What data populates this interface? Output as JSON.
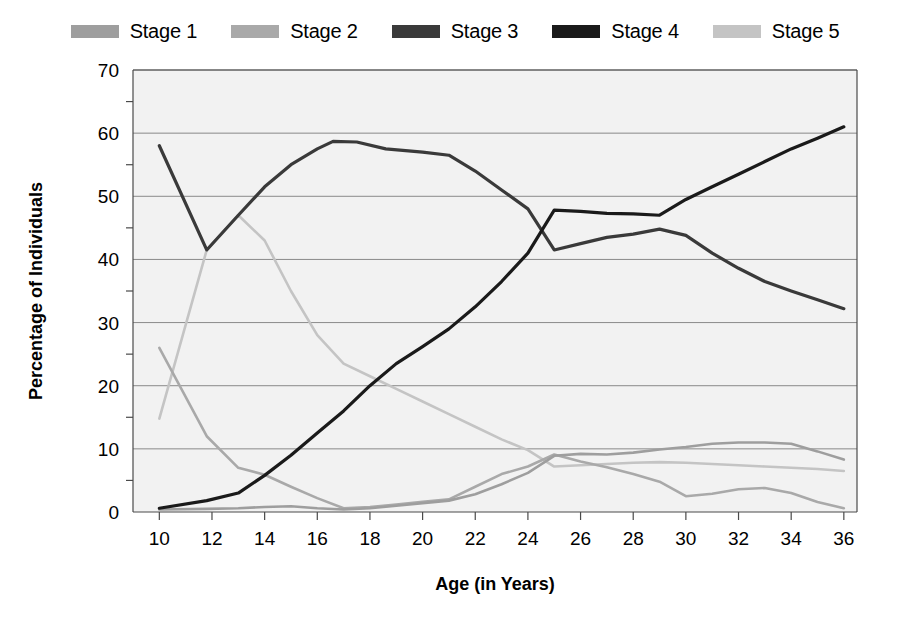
{
  "chart_data": {
    "type": "line",
    "title": "",
    "xlabel": "Age (in Years)",
    "ylabel": "Percentage of Individuals",
    "xlim": [
      9,
      36.5
    ],
    "ylim": [
      0,
      70
    ],
    "xticks": [
      10,
      12,
      14,
      16,
      18,
      20,
      22,
      24,
      26,
      28,
      30,
      32,
      34,
      36
    ],
    "yticks": [
      0,
      10,
      20,
      30,
      40,
      50,
      60,
      70
    ],
    "grid": "horizontal",
    "legend_position": "top",
    "plot_background": "#f2f2f2",
    "series": [
      {
        "name": "Stage 1",
        "color": "#9e9e9e",
        "x": [
          10,
          11.8,
          13,
          14,
          15,
          16,
          17,
          18,
          19,
          20,
          21,
          22,
          23,
          24,
          25,
          26,
          27,
          28,
          29,
          30,
          31,
          32,
          33,
          34,
          35,
          36
        ],
        "values": [
          0.4,
          0.5,
          0.6,
          0.8,
          0.9,
          0.6,
          0.4,
          0.6,
          1.0,
          1.4,
          1.8,
          2.8,
          4.4,
          6.2,
          8.9,
          9.2,
          9.1,
          9.4,
          9.9,
          10.3,
          10.8,
          11.0,
          11.0,
          10.8,
          9.6,
          8.3
        ]
      },
      {
        "name": "Stage 2",
        "color": "#a9a9a9",
        "x": [
          10,
          11.8,
          13,
          14,
          15,
          16,
          17,
          18,
          19,
          20,
          21,
          22,
          23,
          24,
          25,
          26,
          27,
          28,
          29,
          30,
          31,
          32,
          33,
          34,
          35,
          36
        ],
        "values": [
          26.0,
          12.0,
          7.0,
          5.9,
          4.0,
          2.2,
          0.6,
          0.8,
          1.2,
          1.6,
          2.0,
          4.0,
          6.0,
          7.2,
          9.1,
          8.0,
          7.1,
          6.0,
          4.8,
          2.5,
          2.9,
          3.6,
          3.8,
          3.0,
          1.6,
          0.6
        ]
      },
      {
        "name": "Stage 3",
        "color": "#3a3a3a",
        "x": [
          10,
          11.8,
          13,
          14,
          15,
          16,
          16.6,
          17.5,
          18.6,
          20,
          21,
          22,
          23,
          24,
          25,
          26,
          27,
          28,
          29,
          30,
          31,
          32,
          33,
          34,
          35,
          36
        ],
        "values": [
          58.0,
          41.5,
          47.0,
          51.5,
          55.0,
          57.5,
          58.7,
          58.6,
          57.5,
          57.0,
          56.5,
          54.0,
          51.0,
          48.0,
          41.5,
          42.5,
          43.5,
          44.0,
          44.8,
          43.8,
          41.0,
          38.6,
          36.5,
          35.0,
          33.6,
          32.2
        ]
      },
      {
        "name": "Stage 4",
        "color": "#1a1a1a",
        "x": [
          10,
          11.8,
          13,
          14,
          15,
          16,
          17,
          18,
          19,
          20,
          21,
          22,
          23,
          24,
          25,
          26,
          27,
          28,
          29,
          30,
          31,
          32,
          33,
          34,
          35,
          36
        ],
        "values": [
          0.6,
          1.8,
          3.0,
          5.8,
          9.0,
          12.5,
          16.0,
          20.0,
          23.5,
          26.2,
          29.0,
          32.5,
          36.5,
          41.0,
          47.8,
          47.6,
          47.3,
          47.2,
          47.0,
          49.5,
          51.5,
          53.5,
          55.5,
          57.5,
          59.2,
          61.0
        ]
      },
      {
        "name": "Stage 5",
        "color": "#c4c4c4",
        "x": [
          10,
          11.8,
          13,
          14,
          15,
          16,
          17,
          18,
          19,
          20,
          21,
          22,
          23,
          24,
          25,
          26,
          27,
          28,
          29,
          30,
          31,
          32,
          33,
          34,
          35,
          36
        ],
        "values": [
          14.8,
          41.5,
          47.0,
          43.0,
          35.0,
          28.0,
          23.5,
          21.5,
          19.5,
          17.5,
          15.5,
          13.5,
          11.5,
          9.8,
          7.2,
          7.4,
          7.6,
          7.8,
          7.9,
          7.8,
          7.6,
          7.4,
          7.2,
          7.0,
          6.8,
          6.5
        ]
      }
    ],
    "legend": [
      {
        "label": "Stage 1",
        "color": "#9e9e9e"
      },
      {
        "label": "Stage 2",
        "color": "#a9a9a9"
      },
      {
        "label": "Stage 3",
        "color": "#3a3a3a"
      },
      {
        "label": "Stage 4",
        "color": "#1a1a1a"
      },
      {
        "label": "Stage 5",
        "color": "#c4c4c4"
      }
    ]
  }
}
